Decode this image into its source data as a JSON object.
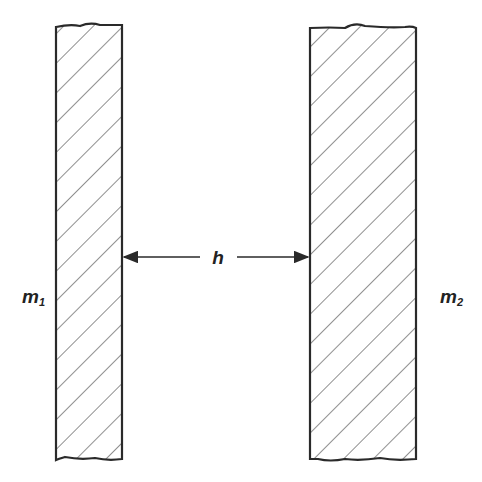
{
  "diagram": {
    "type": "two parallel slabs separated by a gap",
    "colors": {
      "stroke": "#2a2a2a",
      "hatch": "#444444",
      "background": "#ffffff"
    },
    "slabs": [
      {
        "id": "slab-1",
        "label": "m",
        "subscript": "1",
        "x": 56,
        "y": 25,
        "width": 66,
        "height": 436
      },
      {
        "id": "slab-2",
        "label": "m",
        "subscript": "2",
        "x": 310,
        "y": 25,
        "width": 106,
        "height": 436
      }
    ],
    "gap": {
      "label": "h",
      "arrow_y": 257,
      "x_start": 122,
      "x_end": 310
    }
  }
}
